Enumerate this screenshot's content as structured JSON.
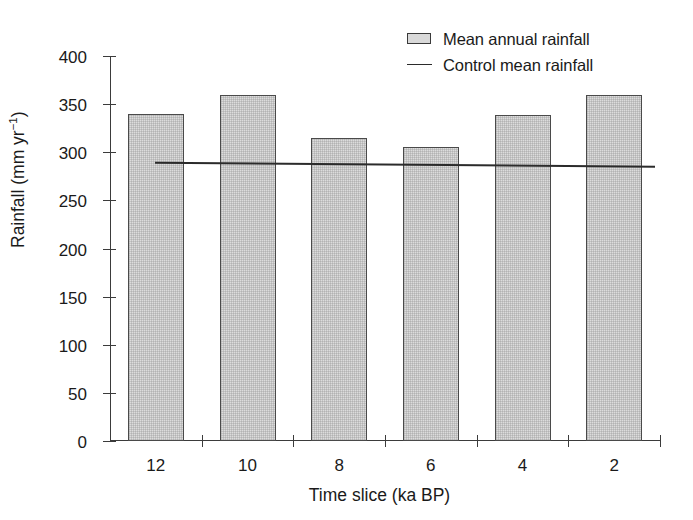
{
  "chart_data": {
    "type": "bar",
    "title": "",
    "xlabel": "Time slice (ka BP)",
    "ylabel": "Rainfall (mm yr−1)",
    "ylabel_base": "Rainfall (mm yr",
    "ylabel_sup": "−1",
    "ylabel_tail": ")",
    "categories": [
      "12",
      "10",
      "8",
      "6",
      "4",
      "2"
    ],
    "values": [
      340,
      360,
      315,
      305,
      339,
      360
    ],
    "series": [
      {
        "name": "Mean annual rainfall",
        "values": [
          340,
          360,
          315,
          305,
          339,
          360
        ]
      }
    ],
    "ylim": [
      0,
      400
    ],
    "ytick_values": [
      0,
      50,
      100,
      150,
      200,
      250,
      300,
      350,
      400
    ],
    "ytick_labels": [
      "0",
      "50",
      "100",
      "150",
      "200",
      "250",
      "300",
      "350",
      "400"
    ],
    "grid": false,
    "legend_position": "top-right",
    "reference_line": {
      "name": "Control mean rainfall",
      "start_value": 289,
      "end_value": 285
    },
    "bar_fill_color": "#dcdcdc",
    "bar_edge_color": "#4a4a4a",
    "line_color": "#2b2b2b",
    "background_color": "#ffffff"
  },
  "legend": {
    "items": [
      {
        "label": "Mean annual rainfall",
        "marker": "box-swatch"
      },
      {
        "label": "Control mean rainfall",
        "marker": "line-swatch"
      }
    ]
  }
}
